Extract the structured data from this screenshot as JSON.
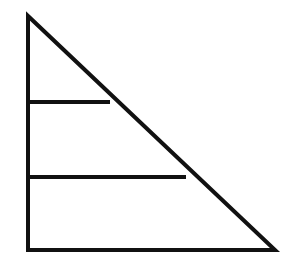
{
  "diagram": {
    "type": "right-triangle-divided",
    "stroke_color": "#111111",
    "background": "#ffffff",
    "stroke_width": 4,
    "triangle": {
      "top": [
        28,
        16
      ],
      "bottom_left": [
        28,
        250
      ],
      "bottom_right": [
        275,
        250
      ]
    },
    "divider_lines": [
      {
        "x1": 28,
        "y1": 102,
        "x2": 110,
        "y2": 102
      },
      {
        "x1": 28,
        "y1": 177,
        "x2": 186,
        "y2": 177
      }
    ]
  }
}
